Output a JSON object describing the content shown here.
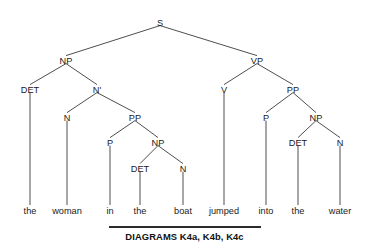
{
  "figure": {
    "type": "syntax-tree",
    "sentence": "the woman in the boat jumped into the water",
    "background_color": "#ffffff",
    "line_color": "#3a3a3a",
    "text_color": "#1a1a1a"
  },
  "nodes": [
    {
      "id": "S",
      "label": "S",
      "x": 160,
      "y": 22,
      "level": 0
    },
    {
      "id": "NP1",
      "label": "NP",
      "x": 66,
      "y": 60,
      "level": 1
    },
    {
      "id": "VP",
      "label": "VP",
      "x": 257,
      "y": 60,
      "level": 1
    },
    {
      "id": "DET1",
      "label": "DET",
      "x": 30,
      "y": 89,
      "level": 2
    },
    {
      "id": "NBAR",
      "label": "N'",
      "x": 97,
      "y": 89,
      "level": 2
    },
    {
      "id": "V",
      "label": "V",
      "x": 224,
      "y": 89,
      "level": 2
    },
    {
      "id": "PP2",
      "label": "PP",
      "x": 293,
      "y": 89,
      "level": 2
    },
    {
      "id": "N1",
      "label": "N",
      "x": 67,
      "y": 117,
      "level": 3
    },
    {
      "id": "PP1",
      "label": "PP",
      "x": 135,
      "y": 117,
      "level": 3
    },
    {
      "id": "P2",
      "label": "P",
      "x": 266,
      "y": 117,
      "level": 3
    },
    {
      "id": "NP3",
      "label": "NP",
      "x": 316,
      "y": 117,
      "level": 3
    },
    {
      "id": "P1",
      "label": "P",
      "x": 110,
      "y": 142,
      "level": 4
    },
    {
      "id": "NP2",
      "label": "NP",
      "x": 158,
      "y": 142,
      "level": 4
    },
    {
      "id": "DET3",
      "label": "DET",
      "x": 298,
      "y": 142,
      "level": 4
    },
    {
      "id": "N3",
      "label": "N",
      "x": 340,
      "y": 142,
      "level": 4
    },
    {
      "id": "DET2",
      "label": "DET",
      "x": 140,
      "y": 168,
      "level": 5
    },
    {
      "id": "N2",
      "label": "N",
      "x": 183,
      "y": 168,
      "level": 5
    }
  ],
  "leaves": [
    {
      "id": "leaf-the-1",
      "label": "the",
      "x": 30,
      "y": 214,
      "parent": "DET1"
    },
    {
      "id": "leaf-woman",
      "label": "woman",
      "x": 67,
      "y": 214,
      "parent": "N1"
    },
    {
      "id": "leaf-in",
      "label": "in",
      "x": 110,
      "y": 214,
      "parent": "P1"
    },
    {
      "id": "leaf-the-2",
      "label": "the",
      "x": 140,
      "y": 214,
      "parent": "DET2"
    },
    {
      "id": "leaf-boat",
      "label": "boat",
      "x": 183,
      "y": 214,
      "parent": "N2"
    },
    {
      "id": "leaf-jumped",
      "label": "jumped",
      "x": 224,
      "y": 214,
      "parent": "V"
    },
    {
      "id": "leaf-into",
      "label": "into",
      "x": 266,
      "y": 214,
      "parent": "P2"
    },
    {
      "id": "leaf-the-3",
      "label": "the",
      "x": 298,
      "y": 214,
      "parent": "DET3"
    },
    {
      "id": "leaf-water",
      "label": "water",
      "x": 340,
      "y": 214,
      "parent": "N3"
    }
  ],
  "edges": [
    {
      "from": "S",
      "to": "NP1"
    },
    {
      "from": "S",
      "to": "VP"
    },
    {
      "from": "NP1",
      "to": "DET1"
    },
    {
      "from": "NP1",
      "to": "NBAR"
    },
    {
      "from": "VP",
      "to": "V"
    },
    {
      "from": "VP",
      "to": "PP2"
    },
    {
      "from": "NBAR",
      "to": "N1"
    },
    {
      "from": "NBAR",
      "to": "PP1"
    },
    {
      "from": "PP1",
      "to": "P1"
    },
    {
      "from": "PP1",
      "to": "NP2"
    },
    {
      "from": "NP2",
      "to": "DET2"
    },
    {
      "from": "NP2",
      "to": "N2"
    },
    {
      "from": "PP2",
      "to": "P2"
    },
    {
      "from": "PP2",
      "to": "NP3"
    },
    {
      "from": "NP3",
      "to": "DET3"
    },
    {
      "from": "NP3",
      "to": "N3"
    }
  ],
  "caption": {
    "text": "DIAGRAMS K4a, K4b, K4c",
    "rule_color": "#2b2b2b"
  }
}
